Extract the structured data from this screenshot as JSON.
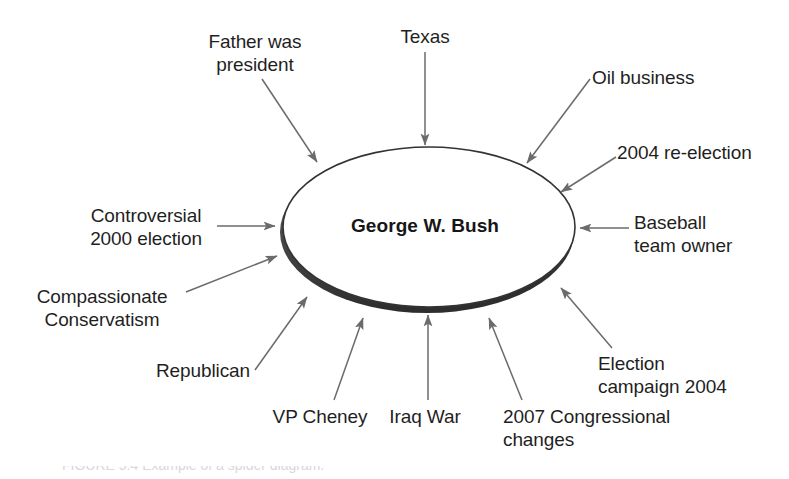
{
  "diagram": {
    "type": "spider-diagram",
    "center": {
      "label": "George W. Bush",
      "shape": "ellipse-3d"
    },
    "colors": {
      "background": "#ffffff",
      "text": "#1f1f1f",
      "center_text": "#161616",
      "ellipse_stroke": "#333333",
      "ellipse_fill": "#ffffff",
      "ellipse_shadow": "#595959",
      "arrow": "#6b6b6b"
    },
    "nodes": [
      {
        "id": "father-was-president",
        "label": "Father was\npresident",
        "align": "center"
      },
      {
        "id": "texas",
        "label": "Texas",
        "align": "center"
      },
      {
        "id": "oil-business",
        "label": "Oil business",
        "align": "left"
      },
      {
        "id": "2004-re-election",
        "label": "2004 re-election",
        "align": "left"
      },
      {
        "id": "baseball-team-owner",
        "label": "Baseball\nteam owner",
        "align": "left"
      },
      {
        "id": "election-campaign-2004",
        "label": "Election\ncampaign 2004",
        "align": "left"
      },
      {
        "id": "2007-congressional-changes",
        "label": "2007 Congressional\nchanges",
        "align": "left"
      },
      {
        "id": "iraq-war",
        "label": "Iraq War",
        "align": "center"
      },
      {
        "id": "vp-cheney",
        "label": "VP Cheney",
        "align": "center"
      },
      {
        "id": "republican",
        "label": "Republican",
        "align": "right"
      },
      {
        "id": "compassionate-conservatism",
        "label": "Compassionate\nConservatism",
        "align": "center"
      },
      {
        "id": "controversial-2000-election",
        "label": "Controversial\n2000 election",
        "align": "center"
      }
    ],
    "caption": "FIGURE 5.4 Example of a spider diagram."
  }
}
